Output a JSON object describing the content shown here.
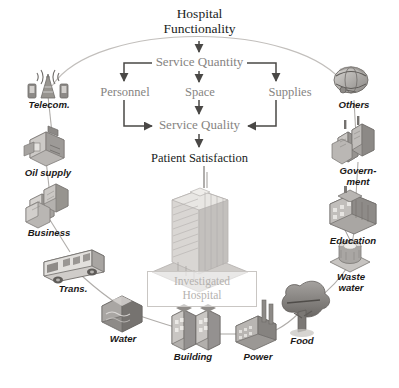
{
  "figure": {
    "background": "#ffffff",
    "accent_gray": "#868482",
    "dark_text": "#201d1c",
    "faint_text": "#b5b2af",
    "arc_color": "#b9b6b3"
  },
  "flow": {
    "title": "Hospital\nFunctionality",
    "title_line1": "Hospital",
    "title_line2": "Functionality",
    "service_quantity": "Service Quantity",
    "personnel": "Personnel",
    "space": "Space",
    "supplies": "Supplies",
    "service_quality": "Service Quality",
    "patient_satisfaction": "Patient Satisfaction"
  },
  "center": {
    "box_line1": "Investigated",
    "box_line2": "Hospital",
    "icon": "hospital-tower-icon"
  },
  "ring": {
    "items": [
      {
        "id": "telecom",
        "label": "Telecom.",
        "label_line1": "Telecom.",
        "label_line2": "",
        "icon": "telecom-tower-icon",
        "x": 48,
        "y": 88
      },
      {
        "id": "oil-supply",
        "label": "Oil supply",
        "label_line1": "Oil",
        "label_line2": "supply",
        "icon": "oil-supply-icon",
        "x": 45,
        "y": 145
      },
      {
        "id": "business",
        "label": "Business",
        "label_line1": "Business",
        "label_line2": "",
        "icon": "business-buildings-icon",
        "x": 48,
        "y": 205
      },
      {
        "id": "trans",
        "label": "Trans.",
        "label_line1": "Trans.",
        "label_line2": "",
        "icon": "bus-icon",
        "x": 68,
        "y": 262
      },
      {
        "id": "water",
        "label": "Water",
        "label_line1": "Water",
        "label_line2": "",
        "icon": "water-reservoir-icon",
        "x": 122,
        "y": 308
      },
      {
        "id": "building",
        "label": "Building",
        "label_line1": "Building",
        "label_line2": "",
        "icon": "building-icon",
        "x": 190,
        "y": 332
      },
      {
        "id": "power",
        "label": "Power",
        "label_line1": "Power",
        "label_line2": "",
        "icon": "power-plant-icon",
        "x": 257,
        "y": 332
      },
      {
        "id": "food",
        "label": "Food",
        "label_line1": "Food",
        "label_line2": "",
        "icon": "tree-food-icon",
        "x": 300,
        "y": 308
      },
      {
        "id": "waste-water",
        "label": "Waste water",
        "label_line1": "Waste",
        "label_line2": "water",
        "icon": "waste-water-tank-icon",
        "x": 350,
        "y": 258
      },
      {
        "id": "education",
        "label": "Education",
        "label_line1": "Education",
        "label_line2": "",
        "icon": "school-icon",
        "x": 355,
        "y": 208
      },
      {
        "id": "government",
        "label": "Govern-ment",
        "label_line1": "Govern-",
        "label_line2": "ment",
        "icon": "government-city-icon",
        "x": 356,
        "y": 148
      },
      {
        "id": "others",
        "label": "Others",
        "label_line1": "Others",
        "label_line2": "",
        "icon": "globe-others-icon",
        "x": 352,
        "y": 88
      }
    ]
  }
}
